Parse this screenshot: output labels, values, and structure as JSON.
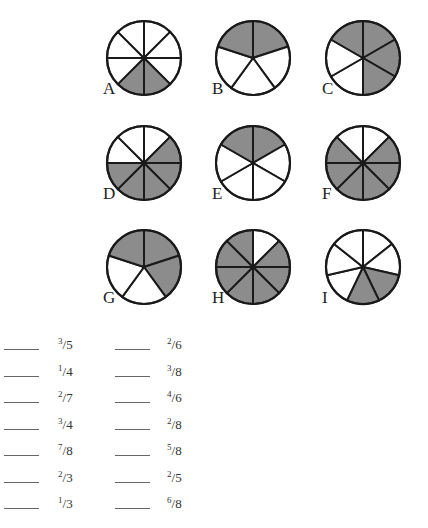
{
  "pies": [
    {
      "label": "A",
      "slices": 8,
      "shaded": [
        3,
        4
      ],
      "cx": 144,
      "cy": 58,
      "offset_deg": 0
    },
    {
      "label": "B",
      "slices": 5,
      "shaded": [
        0,
        4
      ],
      "cx": 253,
      "cy": 58,
      "offset_deg": 0
    },
    {
      "label": "C",
      "slices": 6,
      "shaded": [
        0,
        1,
        2,
        5
      ],
      "cx": 363,
      "cy": 58,
      "offset_deg": 0
    },
    {
      "label": "D",
      "slices": 8,
      "shaded": [
        1,
        2,
        3,
        4,
        5
      ],
      "cx": 144,
      "cy": 163,
      "offset_deg": 0
    },
    {
      "label": "E",
      "slices": 6,
      "shaded": [
        0,
        5
      ],
      "cx": 253,
      "cy": 163,
      "offset_deg": 0
    },
    {
      "label": "F",
      "slices": 8,
      "shaded": [
        1,
        2,
        3,
        4,
        5,
        6
      ],
      "cx": 363,
      "cy": 163,
      "offset_deg": 0
    },
    {
      "label": "G",
      "slices": 5,
      "shaded": [
        0,
        1,
        4
      ],
      "cx": 144,
      "cy": 267,
      "offset_deg": 0
    },
    {
      "label": "H",
      "slices": 8,
      "shaded": [
        1,
        2,
        3,
        4,
        5,
        6,
        7
      ],
      "cx": 253,
      "cy": 267,
      "offset_deg": 0
    },
    {
      "label": "I",
      "slices": 7,
      "shaded": [
        2,
        3
      ],
      "cx": 363,
      "cy": 267,
      "offset_deg": 0
    }
  ],
  "colors": {
    "shade": "#8c8c8c",
    "fill": "#ffffff",
    "stroke": "#1a1a1a"
  },
  "fractions": {
    "left": [
      {
        "num": "3",
        "den": "5"
      },
      {
        "num": "1",
        "den": "4"
      },
      {
        "num": "2",
        "den": "7"
      },
      {
        "num": "3",
        "den": "4"
      },
      {
        "num": "7",
        "den": "8"
      },
      {
        "num": "2",
        "den": "3"
      },
      {
        "num": "1",
        "den": "3"
      }
    ],
    "right": [
      {
        "num": "2",
        "den": "6"
      },
      {
        "num": "3",
        "den": "8"
      },
      {
        "num": "4",
        "den": "6"
      },
      {
        "num": "2",
        "den": "8"
      },
      {
        "num": "5",
        "den": "8"
      },
      {
        "num": "2",
        "den": "5"
      },
      {
        "num": "6",
        "den": "8"
      }
    ]
  }
}
